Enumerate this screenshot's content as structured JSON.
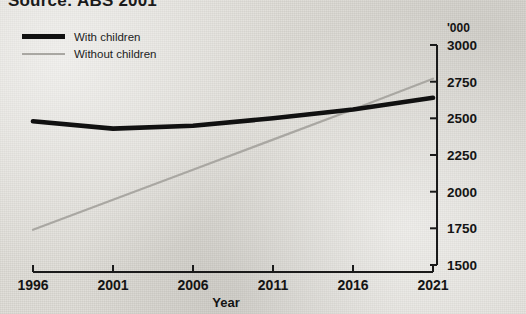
{
  "source_note": {
    "prefix": "Source:",
    "text": "Source: ABS 2001"
  },
  "legend": {
    "position": "top-left",
    "items": [
      {
        "label": "With children",
        "color": "#111111",
        "style": "thick-solid"
      },
      {
        "label": "Without children",
        "color": "#a9a7a2",
        "style": "thin-solid"
      }
    ]
  },
  "axes": {
    "y_unit_label": "'000",
    "y_position": "right",
    "y_ticks": [
      "3000",
      "2750",
      "2500",
      "2250",
      "2000",
      "1750",
      "1500"
    ],
    "x_title": "Year",
    "x_ticks": [
      "1996",
      "2001",
      "2006",
      "2011",
      "2016",
      "2021"
    ]
  },
  "chart_data": {
    "type": "line",
    "title": "",
    "subtitle": "",
    "xlabel": "Year",
    "ylabel": "'000",
    "ylim": [
      1500,
      3000
    ],
    "xlim": [
      1996,
      2021
    ],
    "yticks": [
      1500,
      1750,
      2000,
      2250,
      2500,
      2750,
      3000
    ],
    "xticks": [
      1996,
      2001,
      2006,
      2011,
      2016,
      2021
    ],
    "grid": false,
    "legend_position": "top-left",
    "x": [
      1996,
      2001,
      2006,
      2011,
      2016,
      2021
    ],
    "series": [
      {
        "name": "With children",
        "color": "#111111",
        "values": [
          2480,
          2430,
          2450,
          2500,
          2560,
          2640
        ]
      },
      {
        "name": "Without children",
        "color": "#a9a7a2",
        "values": [
          1740,
          1945,
          2150,
          2355,
          2560,
          2770
        ]
      }
    ],
    "annotations": [
      "Series cross near 2019",
      "Source: ABS 2001"
    ]
  }
}
